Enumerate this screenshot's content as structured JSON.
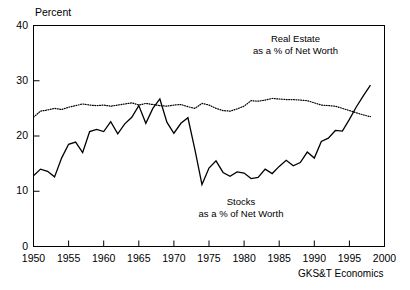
{
  "chart_data": {
    "type": "line",
    "title": "",
    "subtitle": "",
    "xlabel": "",
    "ylabel": "Percent",
    "xlim": [
      1950,
      2000
    ],
    "ylim": [
      0,
      40
    ],
    "grid": false,
    "legend_position": "inline-annotation",
    "xticks": [
      "1950",
      "1955",
      "1960",
      "1965",
      "1970",
      "1975",
      "1980",
      "1985",
      "1990",
      "1995",
      "2000"
    ],
    "yticks": [
      "0",
      "10",
      "20",
      "30",
      "40"
    ],
    "credit": "GKS&T Economics",
    "x": [
      1950,
      1951,
      1952,
      1953,
      1954,
      1955,
      1956,
      1957,
      1958,
      1959,
      1960,
      1961,
      1962,
      1963,
      1964,
      1965,
      1966,
      1967,
      1968,
      1969,
      1970,
      1971,
      1972,
      1973,
      1974,
      1975,
      1976,
      1977,
      1978,
      1979,
      1980,
      1981,
      1982,
      1983,
      1984,
      1985,
      1986,
      1987,
      1988,
      1989,
      1990,
      1991,
      1992,
      1993,
      1994,
      1995,
      1996,
      1997,
      1998
    ],
    "series": [
      {
        "name": "Real Estate",
        "annotation_line1": "Real Estate",
        "annotation_line2": "as a % of Net Worth",
        "style": "dotted",
        "color": "#000000",
        "values": [
          23.4,
          24.5,
          24.7,
          25.0,
          24.8,
          25.2,
          25.5,
          25.8,
          25.6,
          25.5,
          25.6,
          25.4,
          25.6,
          25.8,
          26.0,
          25.6,
          25.9,
          25.7,
          25.5,
          25.4,
          25.6,
          25.7,
          25.3,
          25.0,
          25.9,
          25.6,
          25.0,
          24.6,
          24.5,
          24.9,
          25.4,
          26.4,
          26.3,
          26.5,
          26.8,
          26.7,
          26.6,
          26.6,
          26.5,
          26.4,
          26.0,
          25.6,
          25.5,
          25.4,
          25.0,
          24.6,
          24.2,
          23.8,
          23.5
        ]
      },
      {
        "name": "Stocks",
        "annotation_line1": "Stocks",
        "annotation_line2": "as a % of Net Worth",
        "style": "solid",
        "color": "#000000",
        "values": [
          12.8,
          14.0,
          13.6,
          12.6,
          16.0,
          18.5,
          18.9,
          17.0,
          20.8,
          21.2,
          20.8,
          22.6,
          20.4,
          22.2,
          23.4,
          25.5,
          22.3,
          25.0,
          26.7,
          22.5,
          20.5,
          22.3,
          23.3,
          17.5,
          11.2,
          14.2,
          15.5,
          13.4,
          12.7,
          13.5,
          13.3,
          12.3,
          12.5,
          14.0,
          13.2,
          14.5,
          15.6,
          14.6,
          15.2,
          17.1,
          16.0,
          19.0,
          19.6,
          21.0,
          20.9,
          23.0,
          25.3,
          27.3,
          29.2
        ]
      }
    ]
  },
  "axis": {
    "y_axis_title": "Percent"
  }
}
